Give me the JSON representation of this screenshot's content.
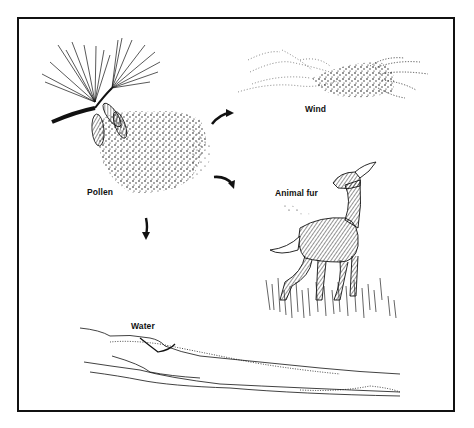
{
  "figure": {
    "type": "illustration",
    "labels": {
      "pollen": "Pollen",
      "wind": "Wind",
      "animal_fur": "Animal fur",
      "water": "Water"
    },
    "arrows": [
      {
        "from": "pollen",
        "to": "wind",
        "direction": "up-right"
      },
      {
        "from": "pollen",
        "to": "animal_fur",
        "direction": "down-right"
      },
      {
        "from": "pollen",
        "to": "water",
        "direction": "down"
      }
    ],
    "colors": {
      "ink": "#111111",
      "background": "#ffffff"
    }
  }
}
